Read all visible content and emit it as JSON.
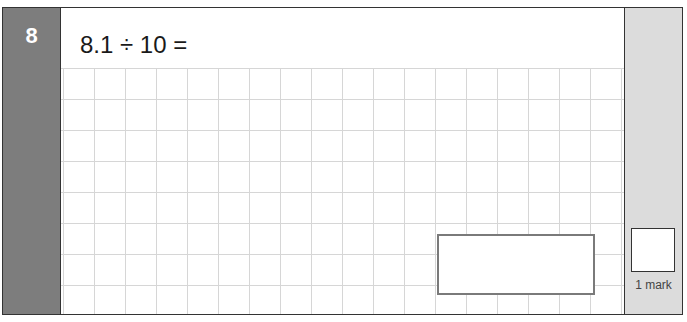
{
  "question": {
    "number": "8",
    "text": "8.1 ÷ 10 =",
    "answer_value": ""
  },
  "marks": {
    "label": "1 mark",
    "awarded": ""
  },
  "colors": {
    "number_panel": "#7d7d7d",
    "mark_panel": "#dcdcdc",
    "grid_line": "#d6d6d6",
    "answer_border": "#7a7a7a"
  }
}
